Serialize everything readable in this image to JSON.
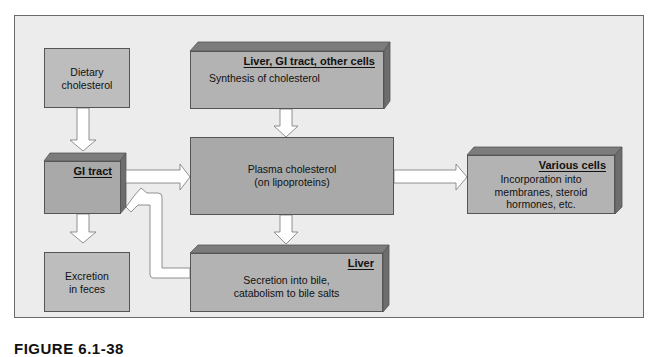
{
  "diagram": {
    "nodes": {
      "dietary": {
        "label": "Dietary cholesterol",
        "lines": [
          "Dietary",
          "cholesterol"
        ]
      },
      "gi_tract": {
        "header": "GI tract"
      },
      "excretion": {
        "lines": [
          "Excretion",
          "in feces"
        ]
      },
      "synthesis": {
        "header": "Liver, GI tract, other cells",
        "text": "Synthesis of cholesterol"
      },
      "plasma": {
        "lines": [
          "Plasma cholesterol",
          "(on lipoproteins)"
        ]
      },
      "liver": {
        "header": "Liver",
        "lines": [
          "Secretion into bile,",
          "catabolism to bile salts"
        ]
      },
      "various": {
        "header": "Various cells",
        "lines": [
          "Incorporation into",
          "membranes, steroid",
          "hormones, etc."
        ]
      }
    },
    "edges": [
      {
        "from": "Dietary cholesterol",
        "to": "GI tract"
      },
      {
        "from": "GI tract",
        "to": "Plasma cholesterol"
      },
      {
        "from": "GI tract",
        "to": "Excretion in feces"
      },
      {
        "from": "Synthesis of cholesterol",
        "to": "Plasma cholesterol"
      },
      {
        "from": "Plasma cholesterol",
        "to": "Various cells"
      },
      {
        "from": "Plasma cholesterol",
        "to": "Liver"
      },
      {
        "from": "Liver",
        "to": "GI tract"
      }
    ]
  },
  "caption": "FIGURE 6.1-38"
}
